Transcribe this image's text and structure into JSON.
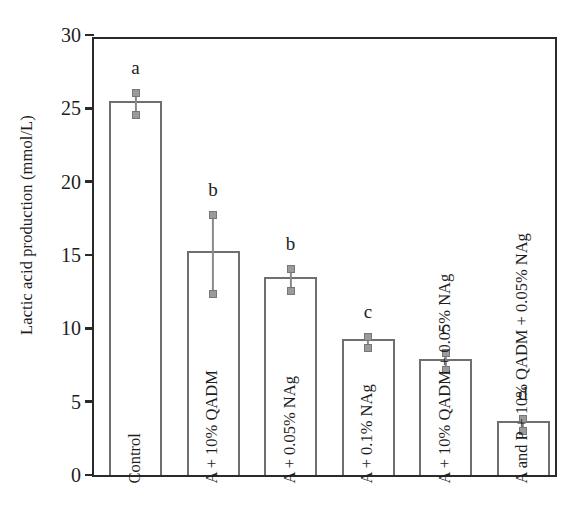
{
  "chart_data": {
    "type": "bar",
    "title": "",
    "xlabel": "",
    "ylabel": "Lactic acid production (mmol/L)",
    "ylim": [
      0,
      30
    ],
    "yticks": [
      0,
      5,
      10,
      15,
      20,
      25,
      30
    ],
    "ytick_labels": [
      "0",
      "5",
      "10",
      "15",
      "20",
      "25",
      "30"
    ],
    "grid": false,
    "legend": "none",
    "categories": [
      "Control",
      "A + 10% QADM",
      "A + 0.05% NAg",
      "A + 0.1% NAg",
      "A + 10% QADM + 0.05% NAg",
      "A and P + 10% QADM + 0.05% NAg"
    ],
    "values": [
      25.5,
      15.3,
      13.5,
      9.3,
      7.9,
      3.7
    ],
    "errors_upper": [
      26.3,
      18.0,
      14.3,
      9.7,
      8.6,
      4.1
    ],
    "errors_lower": [
      24.8,
      12.6,
      12.8,
      8.9,
      7.4,
      3.3
    ],
    "annotations": [
      "a",
      "b",
      "b",
      "c",
      "c",
      "d"
    ],
    "annotation_label": "significance-group-letter",
    "series": [
      {
        "name": "Lactic acid production",
        "values": [
          25.5,
          15.3,
          13.5,
          9.3,
          7.9,
          3.7
        ]
      }
    ]
  },
  "colors": {
    "axis": "#2a2a2a",
    "bar_outline": "#6f6f6f",
    "bar_fill": "#ffffff",
    "error_bar": "#8a8a8a",
    "text": "#1d1d1d",
    "background": "#ffffff"
  }
}
